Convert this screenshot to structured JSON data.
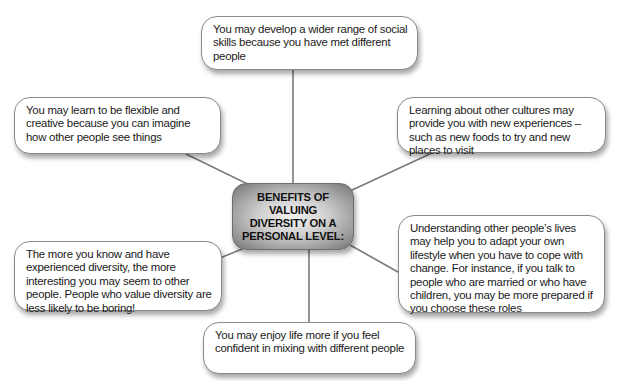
{
  "diagram": {
    "type": "mind-map",
    "center": {
      "label": "BENEFITS OF VALUING DIVERSITY ON A PERSONAL LEVEL:"
    },
    "nodes": [
      {
        "id": "top",
        "text": "You may develop a wider range of social skills because you have met different people"
      },
      {
        "id": "upper-left",
        "text": "You may learn to be flexible and creative because you can imagine how other people see things"
      },
      {
        "id": "upper-right",
        "text": "Learning about other cultures may provide you with new experiences – such as new foods to try and new places to visit"
      },
      {
        "id": "lower-right",
        "text": "Understanding other people’s lives may help you to adapt your own lifestyle when you have to cope with change. For instance, if you talk to people who are married or who have children, you may be more prepared if you choose these roles"
      },
      {
        "id": "lower-left",
        "text": "The more you know and have experienced diversity, the more interesting you may seem to other people. People who value diversity are less likely to be boring!"
      },
      {
        "id": "bottom",
        "text": "You may enjoy life more if you feel confident in mixing with different people"
      }
    ],
    "colors": {
      "connector": "#7a7a7a",
      "bubble_border": "#8a8a8a",
      "center_fill": "#b0b0b0"
    }
  }
}
